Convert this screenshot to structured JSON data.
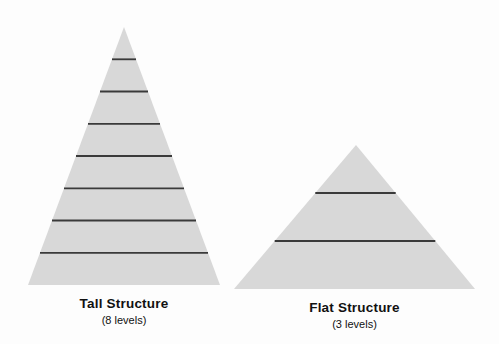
{
  "figure": {
    "background": "#fdfdfd"
  },
  "colors": {
    "pyramid_fill": "#d8d8d8",
    "divider_line": "#3a3a3a",
    "text": "#111111"
  },
  "pyramids": [
    {
      "id": "tall",
      "label": "Tall Structure",
      "sublabel": "(8 levels)",
      "levels": 8,
      "geometry": {
        "apex_x": 124,
        "apex_y": 27,
        "base_y": 285,
        "base_left": 28,
        "base_right": 220
      }
    },
    {
      "id": "flat",
      "label": "Flat Structure",
      "sublabel": "(3 levels)",
      "levels": 3,
      "geometry": {
        "apex_x": 356,
        "apex_y": 145,
        "base_y": 289,
        "base_left": 234,
        "base_right": 475
      }
    }
  ]
}
